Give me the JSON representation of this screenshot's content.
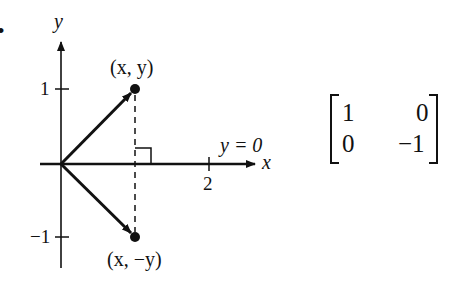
{
  "bullet": "•",
  "axes": {
    "x_label": "x",
    "y_label": "y"
  },
  "ticks": {
    "y_pos": "1",
    "y_neg": "−1",
    "x_2": "2"
  },
  "points": {
    "original": "(x, y)",
    "reflected": "(x, −y)"
  },
  "line_label": "y = 0",
  "matrix": {
    "r1c1": "1",
    "r1c2": "0",
    "r2c1": "0",
    "r2c2": "−1"
  },
  "colors": {
    "ink": "#111111",
    "background": "#ffffff"
  }
}
